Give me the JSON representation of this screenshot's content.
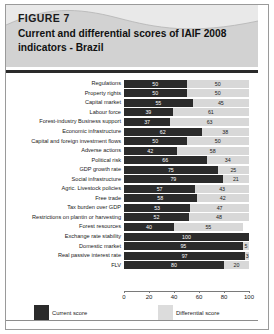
{
  "figure": {
    "label": "FIGURE 7",
    "title": "Current and differential scores of IAIF 2008 indicators - Brazil"
  },
  "legend": {
    "current_label": "Current score",
    "differential_label": "Differential score",
    "current_color": "#2b2b2b",
    "differential_color": "#dcdcdc"
  },
  "chart_data": {
    "type": "bar",
    "orientation": "horizontal",
    "stacked": true,
    "title": "Current and differential scores of IAIF 2008 indicators - Brazil",
    "xlabel": "",
    "ylabel": "",
    "xlim": [
      0,
      100
    ],
    "xticks": [
      0,
      20,
      40,
      60,
      80,
      100
    ],
    "grid": false,
    "legend_position": "bottom",
    "categories": [
      "Regulations",
      "Property rights",
      "Capital market",
      "Labour force",
      "Forest-industry Business support",
      "Economic infrastructure",
      "Capital and foreign investment flows",
      "Adverse actions",
      "Political risk",
      "GDP growth rate",
      "Social infrastructure",
      "Agric. Livestock policies",
      "Free trade",
      "Tax burden over GDP",
      "Restrictions on plantin or harvesting",
      "Forest resources",
      "Exchange rate stability",
      "Domestic market",
      "Real passive interest rate",
      "FLV"
    ],
    "series": [
      {
        "name": "Current score",
        "color": "#2b2b2b",
        "values": [
          50,
          50,
          55,
          39,
          37,
          62,
          50,
          42,
          66,
          75,
          79,
          57,
          58,
          53,
          52,
          40,
          100,
          95,
          97,
          80
        ]
      },
      {
        "name": "Differential score",
        "color": "#dcdcdc",
        "values": [
          50,
          50,
          45,
          61,
          63,
          38,
          50,
          58,
          34,
          25,
          21,
          43,
          42,
          47,
          48,
          55,
          0,
          5,
          3,
          20
        ]
      }
    ]
  }
}
